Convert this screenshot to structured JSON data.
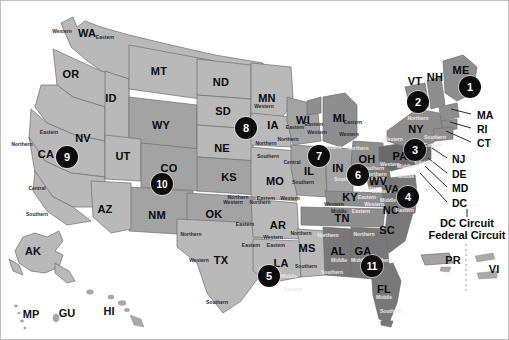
{
  "map": {
    "title": "United States Courts of Appeals and United States District Courts",
    "colors": {
      "background": "#ffffff",
      "land_light": "#b9b9b9",
      "land_mid": "#a3a3a3",
      "land_dark": "#8e8e8e",
      "land_darker": "#787878",
      "land_darkest": "#6a6a6a",
      "border_line": "#6e6e6e",
      "badge_fill": "#0d0d0d",
      "badge_text": "#ffffff",
      "label_text": "#0a0a0a",
      "frame": "#bfbfbf"
    },
    "states": [
      {
        "abbr": "WA",
        "x": 86,
        "y": 32,
        "tone": "land_light"
      },
      {
        "abbr": "OR",
        "x": 70,
        "y": 73,
        "tone": "land_light"
      },
      {
        "abbr": "CA",
        "x": 45,
        "y": 153,
        "tone": "land_light"
      },
      {
        "abbr": "NV",
        "x": 82,
        "y": 137,
        "tone": "land_light"
      },
      {
        "abbr": "ID",
        "x": 110,
        "y": 97,
        "tone": "land_light"
      },
      {
        "abbr": "MT",
        "x": 158,
        "y": 70,
        "tone": "land_light"
      },
      {
        "abbr": "WY",
        "x": 160,
        "y": 124,
        "tone": "land_mid"
      },
      {
        "abbr": "UT",
        "x": 122,
        "y": 155,
        "tone": "land_light"
      },
      {
        "abbr": "CO",
        "x": 168,
        "y": 167,
        "tone": "land_mid"
      },
      {
        "abbr": "AZ",
        "x": 104,
        "y": 208,
        "tone": "land_light"
      },
      {
        "abbr": "NM",
        "x": 156,
        "y": 214,
        "tone": "land_mid"
      },
      {
        "abbr": "ND",
        "x": 220,
        "y": 81,
        "tone": "land_light"
      },
      {
        "abbr": "SD",
        "x": 222,
        "y": 110,
        "tone": "land_light"
      },
      {
        "abbr": "NE",
        "x": 221,
        "y": 147,
        "tone": "land_light"
      },
      {
        "abbr": "KS",
        "x": 228,
        "y": 176,
        "tone": "land_mid"
      },
      {
        "abbr": "OK",
        "x": 213,
        "y": 213,
        "tone": "land_mid"
      },
      {
        "abbr": "TX",
        "x": 220,
        "y": 259,
        "tone": "land_light"
      },
      {
        "abbr": "MN",
        "x": 266,
        "y": 97,
        "tone": "land_light"
      },
      {
        "abbr": "IA",
        "x": 272,
        "y": 124,
        "tone": "land_light"
      },
      {
        "abbr": "MO",
        "x": 274,
        "y": 180,
        "tone": "land_light"
      },
      {
        "abbr": "AR",
        "x": 277,
        "y": 224,
        "tone": "land_light"
      },
      {
        "abbr": "LA",
        "x": 280,
        "y": 262,
        "tone": "land_light"
      },
      {
        "abbr": "MS",
        "x": 306,
        "y": 247,
        "tone": "land_light"
      },
      {
        "abbr": "WI",
        "x": 302,
        "y": 119,
        "tone": "land_mid"
      },
      {
        "abbr": "IL",
        "x": 308,
        "y": 170,
        "tone": "land_mid"
      },
      {
        "abbr": "MI",
        "x": 338,
        "y": 117,
        "tone": "land_dark"
      },
      {
        "abbr": "IN",
        "x": 337,
        "y": 167,
        "tone": "land_mid"
      },
      {
        "abbr": "OH",
        "x": 366,
        "y": 158,
        "tone": "land_dark"
      },
      {
        "abbr": "KY",
        "x": 349,
        "y": 196,
        "tone": "land_dark"
      },
      {
        "abbr": "TN",
        "x": 341,
        "y": 217,
        "tone": "land_dark"
      },
      {
        "abbr": "AL",
        "x": 337,
        "y": 250,
        "tone": "land_darker"
      },
      {
        "abbr": "GA",
        "x": 362,
        "y": 250,
        "tone": "land_darker"
      },
      {
        "abbr": "FL",
        "x": 383,
        "y": 288,
        "tone": "land_darker"
      },
      {
        "abbr": "SC",
        "x": 386,
        "y": 229,
        "tone": "land_darker"
      },
      {
        "abbr": "NC",
        "x": 390,
        "y": 209,
        "tone": "land_darker"
      },
      {
        "abbr": "VA",
        "x": 391,
        "y": 188,
        "tone": "land_darker"
      },
      {
        "abbr": "WV",
        "x": 377,
        "y": 180,
        "tone": "land_darker"
      },
      {
        "abbr": "PA",
        "x": 399,
        "y": 155,
        "tone": "land_darkest"
      },
      {
        "abbr": "NY",
        "x": 415,
        "y": 128,
        "tone": "land_dark"
      },
      {
        "abbr": "VT",
        "x": 414,
        "y": 80,
        "tone": "land_dark"
      },
      {
        "abbr": "NH",
        "x": 434,
        "y": 76,
        "tone": "land_dark"
      },
      {
        "abbr": "ME",
        "x": 460,
        "y": 69,
        "tone": "land_dark"
      }
    ],
    "territories": [
      {
        "abbr": "AK",
        "x": 32,
        "y": 250
      },
      {
        "abbr": "HI",
        "x": 108,
        "y": 310
      },
      {
        "abbr": "MP",
        "x": 30,
        "y": 313
      },
      {
        "abbr": "GU",
        "x": 66,
        "y": 312
      },
      {
        "abbr": "PR",
        "x": 452,
        "y": 259
      },
      {
        "abbr": "VI",
        "x": 493,
        "y": 268
      }
    ],
    "lead_labels": [
      {
        "abbr": "MA",
        "x": 476,
        "y": 114,
        "from_x": 450,
        "from_y": 108
      },
      {
        "abbr": "RI",
        "x": 476,
        "y": 128,
        "from_x": 449,
        "from_y": 121
      },
      {
        "abbr": "CT",
        "x": 476,
        "y": 142,
        "from_x": 445,
        "from_y": 130
      },
      {
        "abbr": "NJ",
        "x": 451,
        "y": 158,
        "from_x": 431,
        "from_y": 147
      },
      {
        "abbr": "DE",
        "x": 451,
        "y": 173,
        "from_x": 427,
        "from_y": 157
      },
      {
        "abbr": "MD",
        "x": 451,
        "y": 187,
        "from_x": 424,
        "from_y": 165
      },
      {
        "abbr": "DC",
        "x": 451,
        "y": 202,
        "from_x": 419,
        "from_y": 172
      }
    ],
    "circuit_notes": [
      {
        "text": "DC Circuit",
        "x": 466,
        "y": 222
      },
      {
        "text": "Federal Circuit",
        "x": 466,
        "y": 234
      }
    ],
    "circuits": [
      {
        "number": "1",
        "x": 469,
        "y": 86,
        "r": 11
      },
      {
        "number": "2",
        "x": 417,
        "y": 101,
        "r": 11
      },
      {
        "number": "3",
        "x": 414,
        "y": 149,
        "r": 11
      },
      {
        "number": "4",
        "x": 407,
        "y": 196,
        "r": 11
      },
      {
        "number": "5",
        "x": 268,
        "y": 275,
        "r": 11
      },
      {
        "number": "6",
        "x": 357,
        "y": 174,
        "r": 11
      },
      {
        "number": "7",
        "x": 318,
        "y": 155,
        "r": 11
      },
      {
        "number": "8",
        "x": 245,
        "y": 127,
        "r": 11
      },
      {
        "number": "9",
        "x": 66,
        "y": 156,
        "r": 11
      },
      {
        "number": "10",
        "x": 161,
        "y": 183,
        "r": 11
      },
      {
        "number": "11",
        "x": 371,
        "y": 265,
        "r": 11
      }
    ],
    "districts": [
      {
        "text": "Western",
        "x": 61,
        "y": 30,
        "shade": "dark"
      },
      {
        "text": "Eastern",
        "x": 104,
        "y": 36,
        "shade": "dark"
      },
      {
        "text": "Eastern",
        "x": 48,
        "y": 131,
        "shade": "dark"
      },
      {
        "text": "Northern",
        "x": 21,
        "y": 143,
        "shade": "dark"
      },
      {
        "text": "Central",
        "x": 36,
        "y": 187,
        "shade": "dark"
      },
      {
        "text": "Southern",
        "x": 36,
        "y": 213,
        "shade": "dark"
      },
      {
        "text": "Western",
        "x": 263,
        "y": 105,
        "shade": "dark"
      },
      {
        "text": "Eastern",
        "x": 294,
        "y": 126,
        "shade": "dark"
      },
      {
        "text": "Northern",
        "x": 265,
        "y": 142,
        "shade": "dark"
      },
      {
        "text": "Southern",
        "x": 267,
        "y": 155,
        "shade": "dark"
      },
      {
        "text": "Northern",
        "x": 287,
        "y": 138,
        "shade": "dark"
      },
      {
        "text": "Central",
        "x": 291,
        "y": 161,
        "shade": "dark"
      },
      {
        "text": "Southern",
        "x": 302,
        "y": 181,
        "shade": "dark"
      },
      {
        "text": "Eastern",
        "x": 313,
        "y": 123,
        "shade": "dark"
      },
      {
        "text": "Western",
        "x": 316,
        "y": 131,
        "shade": "dark"
      },
      {
        "text": "Northern",
        "x": 330,
        "y": 146,
        "shade": "light"
      },
      {
        "text": "Eastern",
        "x": 352,
        "y": 121,
        "shade": "dark"
      },
      {
        "text": "Western",
        "x": 348,
        "y": 133,
        "shade": "dark"
      },
      {
        "text": "Northern",
        "x": 357,
        "y": 147,
        "shade": "light"
      },
      {
        "text": "Southern",
        "x": 344,
        "y": 178,
        "shade": "light"
      },
      {
        "text": "Southern",
        "x": 372,
        "y": 167,
        "shade": "light"
      },
      {
        "text": "Northern",
        "x": 375,
        "y": 173,
        "shade": "light"
      },
      {
        "text": "Eastern",
        "x": 366,
        "y": 196,
        "shade": "light"
      },
      {
        "text": "Western",
        "x": 333,
        "y": 203,
        "shade": "dark"
      },
      {
        "text": "Middle",
        "x": 338,
        "y": 210,
        "shade": "dark"
      },
      {
        "text": "Eastern",
        "x": 360,
        "y": 210,
        "shade": "light"
      },
      {
        "text": "Eastern",
        "x": 265,
        "y": 197,
        "shade": "dark"
      },
      {
        "text": "Western",
        "x": 289,
        "y": 197,
        "shade": "dark"
      },
      {
        "text": "Northern",
        "x": 237,
        "y": 196,
        "shade": "dark"
      },
      {
        "text": "Western",
        "x": 232,
        "y": 201,
        "shade": "dark"
      },
      {
        "text": "Northern",
        "x": 259,
        "y": 201,
        "shade": "dark"
      },
      {
        "text": "Eastern",
        "x": 244,
        "y": 223,
        "shade": "dark"
      },
      {
        "text": "Western",
        "x": 272,
        "y": 236,
        "shade": "dark"
      },
      {
        "text": "Eastern",
        "x": 275,
        "y": 244,
        "shade": "dark"
      },
      {
        "text": "Northern",
        "x": 300,
        "y": 232,
        "shade": "dark"
      },
      {
        "text": "Southern",
        "x": 305,
        "y": 265,
        "shade": "dark"
      },
      {
        "text": "Northern",
        "x": 190,
        "y": 233,
        "shade": "dark"
      },
      {
        "text": "Western",
        "x": 198,
        "y": 259,
        "shade": "dark"
      },
      {
        "text": "Eastern",
        "x": 250,
        "y": 244,
        "shade": "dark"
      },
      {
        "text": "Southern",
        "x": 216,
        "y": 301,
        "shade": "dark"
      },
      {
        "text": "Middle",
        "x": 288,
        "y": 275,
        "shade": "light"
      },
      {
        "text": "Eastern",
        "x": 292,
        "y": 288,
        "shade": "light"
      },
      {
        "text": "Northern",
        "x": 327,
        "y": 234,
        "shade": "light"
      },
      {
        "text": "Middle",
        "x": 338,
        "y": 259,
        "shade": "light"
      },
      {
        "text": "Southern",
        "x": 331,
        "y": 271,
        "shade": "light"
      },
      {
        "text": "Middle",
        "x": 358,
        "y": 259,
        "shade": "light"
      },
      {
        "text": "Southern",
        "x": 380,
        "y": 259,
        "shade": "light"
      },
      {
        "text": "Northern",
        "x": 363,
        "y": 233,
        "shade": "light"
      },
      {
        "text": "Middle",
        "x": 383,
        "y": 296,
        "shade": "light"
      },
      {
        "text": "Southern",
        "x": 390,
        "y": 310,
        "shade": "light"
      },
      {
        "text": "Western",
        "x": 373,
        "y": 203,
        "shade": "light"
      },
      {
        "text": "Middle",
        "x": 387,
        "y": 199,
        "shade": "light"
      },
      {
        "text": "Eastern",
        "x": 404,
        "y": 209,
        "shade": "light"
      },
      {
        "text": "Western",
        "x": 380,
        "y": 190,
        "shade": "light"
      },
      {
        "text": "Eastern",
        "x": 408,
        "y": 190,
        "shade": "light"
      },
      {
        "text": "Middle",
        "x": 405,
        "y": 175,
        "shade": "light"
      },
      {
        "text": "Northern",
        "x": 369,
        "y": 187,
        "shade": "light"
      },
      {
        "text": "Southern",
        "x": 374,
        "y": 177,
        "shade": "light"
      },
      {
        "text": "Western",
        "x": 392,
        "y": 138,
        "shade": "light"
      },
      {
        "text": "Middle",
        "x": 404,
        "y": 165,
        "shade": "light"
      },
      {
        "text": "Western",
        "x": 389,
        "y": 163,
        "shade": "light"
      },
      {
        "text": "Eastern",
        "x": 423,
        "y": 161,
        "shade": "light"
      },
      {
        "text": "Northern",
        "x": 417,
        "y": 117,
        "shade": "light"
      },
      {
        "text": "Southern",
        "x": 434,
        "y": 136,
        "shade": "light"
      },
      {
        "text": "Eastern",
        "x": 432,
        "y": 144,
        "shade": "light"
      }
    ]
  }
}
